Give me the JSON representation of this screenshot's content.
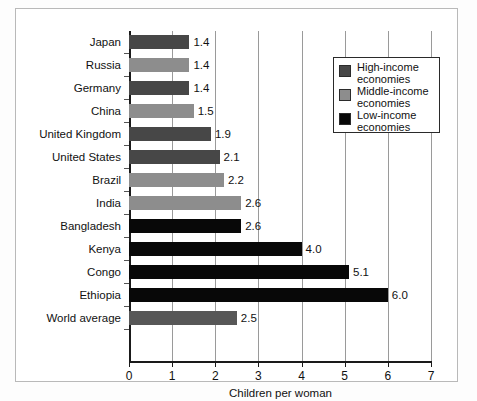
{
  "chart_data": {
    "type": "bar",
    "orientation": "horizontal",
    "title": "",
    "xlabel": "Children per woman",
    "ylabel": "",
    "xlim": [
      0,
      7
    ],
    "xticks": [
      "0",
      "1",
      "2",
      "3",
      "4",
      "5",
      "6",
      "7"
    ],
    "grid": true,
    "grid_axis": "x",
    "legend_position": "upper-right",
    "categories": [
      "Japan",
      "Russia",
      "Germany",
      "China",
      "United Kingdom",
      "United States",
      "Brazil",
      "India",
      "Bangladesh",
      "Kenya",
      "Congo",
      "Ethiopia",
      "World average"
    ],
    "values": [
      1.4,
      1.4,
      1.4,
      1.5,
      1.9,
      2.1,
      2.2,
      2.6,
      2.6,
      4.0,
      5.1,
      6.0,
      2.5
    ],
    "value_labels": [
      "1.4",
      "1.4",
      "1.4",
      "1.5",
      "1.9",
      "2.1",
      "2.2",
      "2.6",
      "2.6",
      "4.0",
      "5.1",
      "6.0",
      "2.5"
    ],
    "groups": [
      "high",
      "middle",
      "high",
      "middle",
      "high",
      "high",
      "middle",
      "middle",
      "low",
      "low",
      "low",
      "low",
      "world"
    ],
    "series": [
      {
        "name": "High-income economies",
        "key": "high",
        "color": "#474747",
        "members": [
          "Japan",
          "Germany",
          "United Kingdom",
          "United States"
        ]
      },
      {
        "name": "Middle-income economies",
        "key": "middle",
        "color": "#8d8d8d",
        "members": [
          "Russia",
          "China",
          "Brazil",
          "India"
        ]
      },
      {
        "name": "Low-income economies",
        "key": "low",
        "color": "#080808",
        "members": [
          "Bangladesh",
          "Kenya",
          "Congo",
          "Ethiopia"
        ]
      }
    ]
  },
  "legend": {
    "items": [
      {
        "label": "High-income economies",
        "swatch": "high"
      },
      {
        "label": "Middle-income economies",
        "swatch": "middle"
      },
      {
        "label": "Low-income economies",
        "swatch": "low"
      }
    ]
  },
  "axis": {
    "x_label": "Children per woman"
  }
}
